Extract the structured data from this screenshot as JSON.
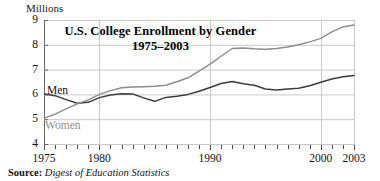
{
  "figure": {
    "unit_label": "Millions",
    "title_line1": "U.S. College Enrollment by Gender",
    "title_line2": "1975–2003",
    "source_prefix": "Source:",
    "source_text": "Digest of Education Statistics",
    "men_label": "Men",
    "women_label": "Women",
    "men_color": "#3c3c3c",
    "women_color": "#8d8d8d",
    "grid_color": "#c9c9c9",
    "axis_color": "#6b6b6b"
  },
  "chart_data": {
    "type": "line",
    "title": "U.S. College Enrollment by Gender 1975–2003",
    "xlabel": "",
    "ylabel": "Millions",
    "xlim": [
      1975,
      2003
    ],
    "ylim": [
      4,
      9
    ],
    "ytick_labels": [
      "9",
      "8",
      "7",
      "6",
      "5",
      "4"
    ],
    "yticks": [
      9,
      8,
      7,
      6,
      5,
      4
    ],
    "xtick_labels": [
      "1975",
      "1980",
      "1990",
      "2000",
      "2003"
    ],
    "xticks_labeled": [
      1975,
      1980,
      1990,
      2000,
      2003
    ],
    "xticks_minor_every": 1,
    "grid": true,
    "legend_position": "inline-series-labels",
    "x": [
      1975,
      1976,
      1977,
      1978,
      1979,
      1980,
      1981,
      1982,
      1983,
      1984,
      1985,
      1986,
      1987,
      1988,
      1989,
      1990,
      1991,
      1992,
      1993,
      1994,
      1995,
      1996,
      1997,
      1998,
      1999,
      2000,
      2001,
      2002,
      2003
    ],
    "series": [
      {
        "name": "Men",
        "color": "#3c3c3c",
        "values": [
          6.02,
          5.95,
          5.79,
          5.64,
          5.68,
          5.87,
          5.98,
          6.03,
          6.02,
          5.86,
          5.72,
          5.88,
          5.93,
          6.0,
          6.13,
          6.28,
          6.44,
          6.52,
          6.43,
          6.37,
          6.22,
          6.18,
          6.22,
          6.25,
          6.35,
          6.49,
          6.62,
          6.71,
          6.76
        ]
      },
      {
        "name": "Women",
        "color": "#8d8d8d",
        "values": [
          5.04,
          5.2,
          5.42,
          5.62,
          5.78,
          6.0,
          6.15,
          6.27,
          6.3,
          6.31,
          6.33,
          6.37,
          6.51,
          6.67,
          6.94,
          7.22,
          7.54,
          7.85,
          7.87,
          7.84,
          7.82,
          7.85,
          7.91,
          8.0,
          8.12,
          8.26,
          8.52,
          8.72,
          8.8
        ]
      }
    ]
  }
}
